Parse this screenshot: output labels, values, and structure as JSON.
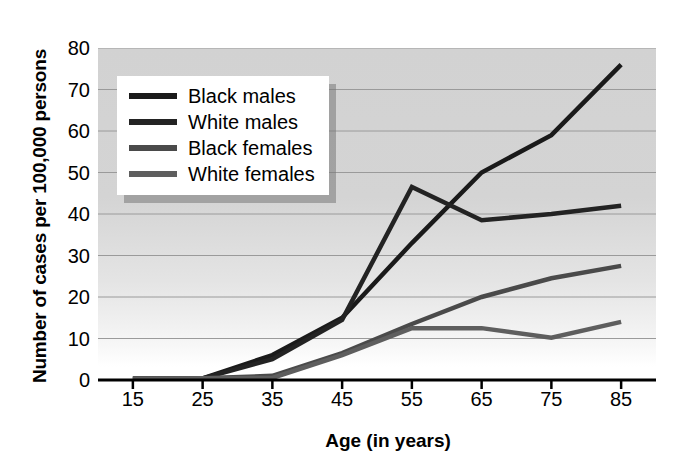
{
  "chart_data": {
    "type": "line",
    "title": "",
    "xlabel": "Age (in years)",
    "ylabel": "Number of cases per 100,000 persons",
    "x": [
      15,
      25,
      35,
      45,
      55,
      65,
      75,
      85
    ],
    "xtick_labels": [
      "15",
      "25",
      "35",
      "45",
      "55",
      "65",
      "75",
      "85"
    ],
    "ytick_labels": [
      "0",
      "10",
      "20",
      "30",
      "40",
      "50",
      "60",
      "70",
      "80"
    ],
    "yticks": [
      0,
      10,
      20,
      30,
      40,
      50,
      60,
      70,
      80
    ],
    "ylim": [
      0,
      80
    ],
    "grid": true,
    "legend_position": "upper-left",
    "series": [
      {
        "name": "Black males",
        "color": "#1a1a1a",
        "values": [
          0.3,
          0.4,
          6.0,
          15.0,
          33.0,
          50.0,
          59.0,
          76.0
        ]
      },
      {
        "name": "White males",
        "color": "#232323",
        "values": [
          0.3,
          0.4,
          5.0,
          14.5,
          46.5,
          38.5,
          40.0,
          42.0
        ]
      },
      {
        "name": "Black females",
        "color": "#4a4a4a",
        "values": [
          0.3,
          0.4,
          1.0,
          6.5,
          13.5,
          20.0,
          24.5,
          27.5
        ]
      },
      {
        "name": "White females",
        "color": "#5e5e5e",
        "values": [
          0.3,
          0.4,
          0.5,
          6.0,
          12.5,
          12.5,
          10.2,
          14.0
        ]
      }
    ]
  },
  "legend": {
    "items": [
      {
        "label": "Black males"
      },
      {
        "label": "White males"
      },
      {
        "label": "Black females"
      },
      {
        "label": "White females"
      }
    ]
  }
}
